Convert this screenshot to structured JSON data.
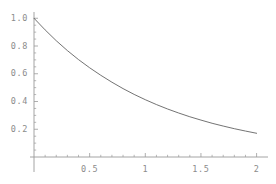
{
  "chart_data": {
    "type": "line",
    "title": "",
    "subtitle": "",
    "xlabel": "",
    "ylabel": "",
    "xlim": [
      0,
      2.0
    ],
    "ylim": [
      0,
      1.05
    ],
    "grid": false,
    "legend": null,
    "axis_color": "#9a9a9a",
    "curve_color": "#5a5a5a",
    "tick_label_color": "#8c8c8c",
    "background_color": "#ffffff",
    "x_ticks_major": [
      "0.5",
      "1",
      "1.5",
      "2"
    ],
    "x_ticks_major_values": [
      0.5,
      1.0,
      1.5,
      2.0
    ],
    "x_ticks_minor_values": [
      0.1,
      0.2,
      0.3,
      0.4,
      0.6,
      0.7,
      0.8,
      0.9,
      1.1,
      1.2,
      1.3,
      1.4,
      1.6,
      1.7,
      1.8,
      1.9
    ],
    "y_ticks_major": [
      "0.2",
      "0.4",
      "0.6",
      "0.8",
      "1.0"
    ],
    "y_ticks_major_values": [
      0.2,
      0.4,
      0.6,
      0.8,
      1.0
    ],
    "y_ticks_minor_values": [
      0.05,
      0.1,
      0.15,
      0.25,
      0.3,
      0.35,
      0.45,
      0.5,
      0.55,
      0.65,
      0.7,
      0.75,
      0.85,
      0.9,
      0.95
    ],
    "series": [
      {
        "name": "decay",
        "x": [
          0.0,
          0.1,
          0.2,
          0.3,
          0.4,
          0.5,
          0.6,
          0.7,
          0.8,
          0.9,
          1.0,
          1.1,
          1.2,
          1.3,
          1.4,
          1.5,
          1.6,
          1.7,
          1.8,
          1.9,
          2.0
        ],
        "values": [
          1.0,
          0.916,
          0.838,
          0.767,
          0.702,
          0.643,
          0.589,
          0.539,
          0.493,
          0.451,
          0.413,
          0.378,
          0.346,
          0.317,
          0.29,
          0.266,
          0.243,
          0.223,
          0.204,
          0.187,
          0.171
        ]
      }
    ]
  },
  "ticks": {
    "y": [
      {
        "label": "1.0"
      },
      {
        "label": "0.8"
      },
      {
        "label": "0.6"
      },
      {
        "label": "0.4"
      },
      {
        "label": "0.2"
      }
    ],
    "x": [
      {
        "label": "0.5"
      },
      {
        "label": "1"
      },
      {
        "label": "1.5"
      },
      {
        "label": "2"
      }
    ]
  }
}
